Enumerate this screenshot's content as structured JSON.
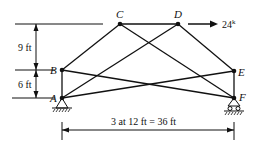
{
  "diagram": {
    "type": "truss",
    "nodes": [
      {
        "id": "A",
        "label": "A",
        "x": 62,
        "y": 98
      },
      {
        "id": "B",
        "label": "B",
        "x": 62,
        "y": 70
      },
      {
        "id": "C",
        "label": "C",
        "x": 120,
        "y": 24
      },
      {
        "id": "D",
        "label": "D",
        "x": 178,
        "y": 24
      },
      {
        "id": "E",
        "label": "E",
        "x": 234,
        "y": 71
      },
      {
        "id": "F",
        "label": "F",
        "x": 234,
        "y": 98
      }
    ],
    "members": [
      [
        "A",
        "B"
      ],
      [
        "B",
        "C"
      ],
      [
        "C",
        "D"
      ],
      [
        "D",
        "E"
      ],
      [
        "E",
        "F"
      ],
      [
        "A",
        "D"
      ],
      [
        "C",
        "F"
      ],
      [
        "A",
        "E"
      ],
      [
        "B",
        "F"
      ]
    ],
    "load": {
      "node": "D",
      "label": "24k",
      "direction": "right"
    },
    "dimensions": {
      "upper_vertical": "9 ft",
      "lower_vertical": "6 ft",
      "horizontal": "3 at 12 ft = 36 ft"
    },
    "supports": {
      "A": "pin",
      "F": "roller"
    }
  }
}
